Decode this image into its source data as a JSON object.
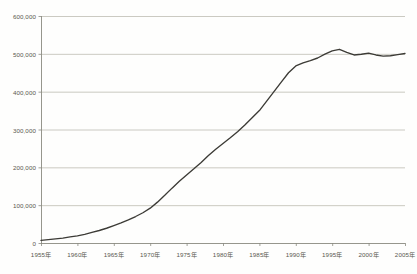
{
  "chart_data": {
    "type": "line",
    "title": "",
    "xlabel": "",
    "ylabel": "",
    "grid": true,
    "legend": "none",
    "xlim": [
      1955,
      2005
    ],
    "ylim": [
      0,
      600000
    ],
    "y_ticks": [
      0,
      100000,
      200000,
      300000,
      400000,
      500000,
      600000
    ],
    "y_tick_labels": [
      "0",
      "100,000",
      "200,000",
      "300,000",
      "400,000",
      "500,000",
      "600,000"
    ],
    "x_ticks": [
      1955,
      1960,
      1965,
      1970,
      1975,
      1980,
      1985,
      1990,
      1995,
      2000,
      2005
    ],
    "x_tick_labels": [
      "1955年",
      "1960年",
      "1965年",
      "1970年",
      "1975年",
      "1980年",
      "1985年",
      "1990年",
      "1995年",
      "2000年",
      "2005年"
    ],
    "series": [
      {
        "name": "series-1",
        "color": "#3c3b36",
        "x": [
          1955,
          1956,
          1957,
          1958,
          1959,
          1960,
          1961,
          1962,
          1963,
          1964,
          1965,
          1966,
          1967,
          1968,
          1969,
          1970,
          1971,
          1972,
          1973,
          1974,
          1975,
          1976,
          1977,
          1978,
          1979,
          1980,
          1981,
          1982,
          1983,
          1984,
          1985,
          1986,
          1987,
          1988,
          1989,
          1990,
          1991,
          1992,
          1993,
          1994,
          1995,
          1996,
          1997,
          1998,
          1999,
          2000,
          2001,
          2002,
          2003,
          2004,
          2005
        ],
        "values": [
          7000,
          9000,
          11000,
          13000,
          16000,
          19000,
          23000,
          28000,
          33000,
          39000,
          46000,
          53000,
          61000,
          70000,
          80000,
          92000,
          108000,
          126000,
          145000,
          163000,
          180000,
          196000,
          213000,
          231000,
          248000,
          263000,
          278000,
          294000,
          312000,
          331000,
          350000,
          375000,
          400000,
          425000,
          450000,
          468000,
          476000,
          482000,
          489000,
          499000,
          508000,
          512000,
          504000,
          497000,
          499000,
          502000,
          497000,
          494000,
          495000,
          498000,
          501000
        ]
      }
    ],
    "axis_color": "#8a8a80",
    "grid_color": "#b9b8ae",
    "background": "#fefefd",
    "plot_area": {
      "left": 41,
      "right": 405,
      "top": 16,
      "bottom": 243
    }
  }
}
